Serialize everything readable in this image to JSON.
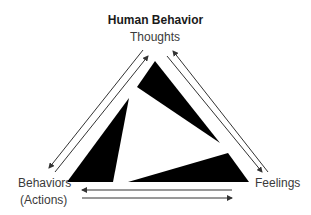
{
  "diagram": {
    "title": "Human Behavior",
    "nodes": {
      "top": "Thoughts",
      "bottom_left_line1": "Behaviors",
      "bottom_left_line2": "(Actions)",
      "bottom_right": "Feelings"
    },
    "edges": [
      {
        "from": "Thoughts",
        "to": "Behaviors (Actions)"
      },
      {
        "from": "Behaviors (Actions)",
        "to": "Thoughts"
      },
      {
        "from": "Feelings",
        "to": "Thoughts"
      },
      {
        "from": "Thoughts",
        "to": "Feelings"
      },
      {
        "from": "Feelings",
        "to": "Behaviors (Actions)"
      },
      {
        "from": "Behaviors (Actions)",
        "to": "Feelings"
      }
    ],
    "colors": {
      "text": "#3a3a3a",
      "shapes": "#000000",
      "arrows": "#333333"
    }
  }
}
